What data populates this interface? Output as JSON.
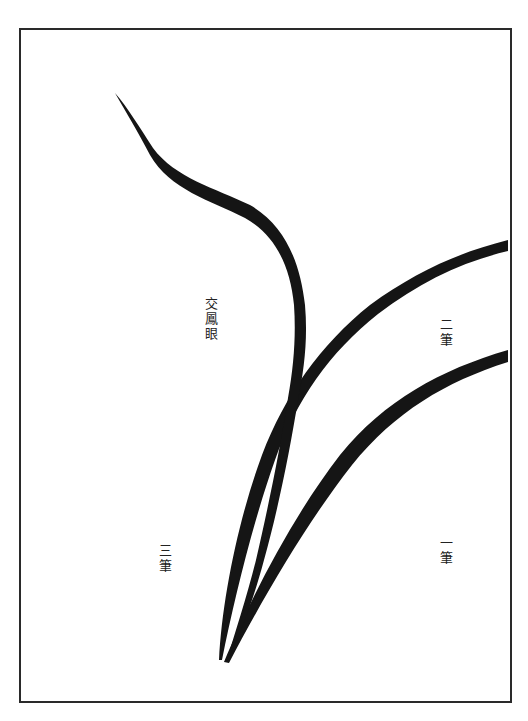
{
  "illustration": {
    "subject": "orchid leaf brush strokes",
    "colors": {
      "ink": "#151515",
      "frame": "#2a2a2a",
      "paper": "#ffffff"
    },
    "labels": {
      "crossing": "交鳳眼",
      "stroke_one": "一筆",
      "stroke_two": "二筆",
      "stroke_three": "三筆"
    }
  }
}
